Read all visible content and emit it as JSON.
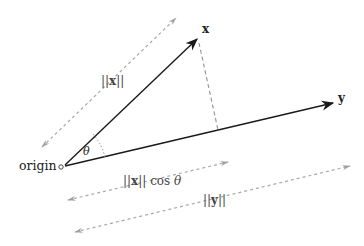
{
  "diagram": {
    "colors": {
      "vector": "#1a1a1a",
      "dimension": "#a0a0a0",
      "perpendicular": "#909090",
      "background": "#ffffff"
    },
    "nodes": {
      "origin": {
        "label": "origin",
        "x": 61,
        "y": 167
      },
      "x_tip": {
        "label": "x",
        "x": 198,
        "y": 38
      },
      "y_tip": {
        "label": "y",
        "x": 334,
        "y": 103
      },
      "projection_foot": {
        "x": 218,
        "y": 130
      }
    },
    "vectors": [
      {
        "name": "x",
        "from": "origin",
        "to": "x_tip"
      },
      {
        "name": "y",
        "from": "origin",
        "to": "y_tip"
      }
    ],
    "angle": {
      "label": "θ"
    },
    "dimensions": {
      "norm_x": {
        "label_pre": "||",
        "label_var": "x",
        "label_post": "||"
      },
      "projection": {
        "label_pre": "||",
        "label_var": "x",
        "label_post": "|| cos ",
        "label_angle": "θ"
      },
      "norm_y": {
        "label_pre": "||",
        "label_var": "y",
        "label_post": "||"
      }
    }
  }
}
